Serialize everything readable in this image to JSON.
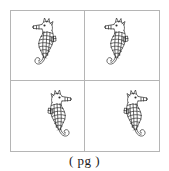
{
  "figure": {
    "caption": "( pg )",
    "panel": {
      "rows": 2,
      "columns": 2,
      "border_color": "#b5b5b5",
      "background_color": "#ffffff"
    },
    "cells": [
      {
        "id": "top-left",
        "subject": "seahorse",
        "facing": "left",
        "alt": "line-drawn seahorse facing left"
      },
      {
        "id": "top-right",
        "subject": "seahorse",
        "facing": "left",
        "alt": "line-drawn seahorse facing left"
      },
      {
        "id": "bottom-left",
        "subject": "seahorse",
        "facing": "right",
        "alt": "line-drawn seahorse facing right"
      },
      {
        "id": "bottom-right",
        "subject": "seahorse",
        "facing": "right",
        "alt": "line-drawn seahorse facing right"
      }
    ],
    "ink_color": "#2b2b2b"
  }
}
